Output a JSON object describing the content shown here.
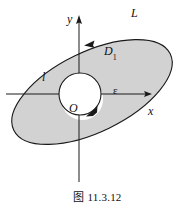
{
  "figure": {
    "caption": "图 11.3.12",
    "background_color": "#ffffff",
    "stroke_color": "#1a1a1a",
    "region_fill_color": "#d2d2d2",
    "hole_fill_color": "#ffffff"
  },
  "axes": {
    "x_label": "x",
    "y_label": "y",
    "origin_label": "O",
    "x_axis_y": 94,
    "y_axis_x": 79,
    "x_axis_start": 6,
    "x_axis_end": 150,
    "y_axis_top": 17,
    "y_axis_bottom": 182
  },
  "labels": {
    "outer_curve": "L",
    "region": "D",
    "region_subscript": "1",
    "inner_curve": "l",
    "radius": "ε"
  },
  "shapes": {
    "outer_ellipse": {
      "name": "L",
      "center_x": 92,
      "center_y": 92,
      "semi_major": 87,
      "semi_minor": 40,
      "rotation_deg": -26,
      "orientation": "counterclockwise"
    },
    "inner_circle": {
      "name": "l",
      "center_x": 80,
      "center_y": 94,
      "radius": 21,
      "orientation": "clockwise"
    }
  },
  "arrows": {
    "outer_arrowhead": {
      "x": 90,
      "y": 43,
      "direction": "left"
    },
    "inner_arrowhead": {
      "x": 95,
      "y": 113,
      "direction": "down-left"
    },
    "x_axis_arrowhead": {
      "x": 150,
      "y": 94,
      "direction": "right"
    },
    "y_axis_arrowhead": {
      "x": 79,
      "y": 17,
      "direction": "up"
    }
  }
}
